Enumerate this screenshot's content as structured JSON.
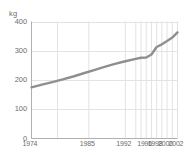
{
  "chart_data": {
    "type": "line",
    "title": "",
    "xlabel": "",
    "ylabel": "kg",
    "unit_label": "kg",
    "xlim": [
      1974,
      2002
    ],
    "ylim": [
      0,
      400
    ],
    "grid": true,
    "legend": "none",
    "line_color": "#8f8f8f",
    "axis_color": "#b0b0b0",
    "grid_color": "#e3e3e3",
    "text_color": "#6d6d6d",
    "y_ticks": [
      "0",
      "100",
      "200",
      "300",
      "400"
    ],
    "y_tick_values": [
      0,
      100,
      200,
      300,
      400
    ],
    "x_ticks": [
      "1974",
      "1985",
      "1992",
      "1996",
      "1998",
      "2000",
      "2002"
    ],
    "x_tick_values": [
      1974,
      1985,
      1992,
      1996,
      1998,
      2000,
      2002
    ],
    "series": [
      {
        "name": "kg",
        "x": [
          1974,
          1976,
          1978,
          1980,
          1982,
          1984,
          1986,
          1988,
          1990,
          1992,
          1994,
          1995,
          1996,
          1997,
          1998,
          1999,
          2000,
          2001,
          2002
        ],
        "values": [
          175,
          184,
          193,
          202,
          212,
          223,
          234,
          245,
          255,
          264,
          272,
          276,
          277,
          287,
          313,
          322,
          333,
          345,
          363
        ]
      }
    ]
  }
}
